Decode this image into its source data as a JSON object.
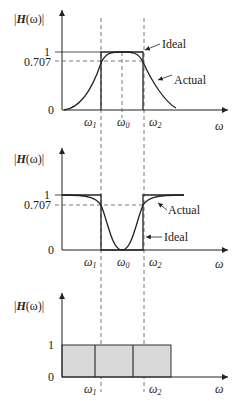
{
  "figure": {
    "panels": [
      {
        "id": "bandpass",
        "ylabel": "|H(ω)|",
        "ylabel_parts": {
          "left": "|",
          "H": "H",
          "arg": "(ω)",
          "right": "|"
        },
        "yticks": [
          "1",
          "0.707",
          "0"
        ],
        "xticks": [
          "ω1",
          "ω0",
          "ω2"
        ],
        "xlabel": "ω",
        "annotations": [
          "Ideal",
          "Actual"
        ]
      },
      {
        "id": "bandstop",
        "ylabel": "|H(ω)|",
        "yticks": [
          "1",
          "0.707",
          "0"
        ],
        "xticks": [
          "ω1",
          "ω0",
          "ω2"
        ],
        "xlabel": "ω",
        "annotations": [
          "Actual",
          "Ideal"
        ]
      },
      {
        "id": "allpass",
        "ylabel": "|H(ω)|",
        "yticks": [
          "1",
          "0"
        ],
        "xticks": [
          "ω1",
          "ω2"
        ],
        "xlabel": "ω",
        "annotations": []
      }
    ]
  },
  "labels": {
    "H": "H",
    "omega_paren": "(ω)",
    "one": "1",
    "p707": "0.707",
    "zero": "0",
    "w": "ω",
    "w1": "1",
    "w0": "0",
    "w2": "2",
    "ideal": "Ideal",
    "actual": "Actual"
  },
  "colors": {
    "line": "#222222",
    "fill": "#d9d9d9",
    "dash": "#555555"
  }
}
